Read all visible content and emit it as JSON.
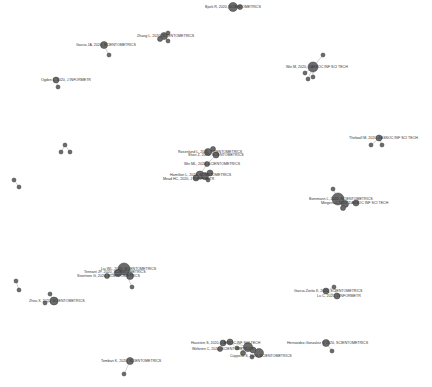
{
  "diagram": {
    "type": "network",
    "background": "#ffffff",
    "node_color": "#6b6b6b",
    "node_stroke": "#3a3a3a",
    "edge_color": "#c8c8c8",
    "label_color": "#333333",
    "nodes": [
      {
        "id": "n1",
        "x": 233,
        "y": 7,
        "r": 4.5,
        "label": "Bjork R, 2020, SCIENTOMETRICS",
        "lx": 205
      },
      {
        "id": "n1b",
        "x": 240,
        "y": 7,
        "r": 2.5
      },
      {
        "id": "n2",
        "x": 164,
        "y": 36,
        "r": 3.5,
        "label": "Zhang L, 2020, SCIENTOMETRICS",
        "lx": 137
      },
      {
        "id": "n2b",
        "x": 160,
        "y": 39,
        "r": 2.5
      },
      {
        "id": "n2c",
        "x": 168,
        "y": 33,
        "r": 2
      },
      {
        "id": "n2d",
        "x": 168,
        "y": 41,
        "r": 2
      },
      {
        "id": "n3",
        "x": 104,
        "y": 45,
        "r": 3.5,
        "label": "Garcia JA, 2020, SCIENTOMETRICS",
        "lx": 76
      },
      {
        "id": "n3b",
        "x": 109,
        "y": 55,
        "r": 2
      },
      {
        "id": "n4",
        "x": 56,
        "y": 80,
        "r": 3,
        "label": "Ogden L, 2020, J INFORMETR",
        "lx": 41
      },
      {
        "id": "n4b",
        "x": 58,
        "y": 87,
        "r": 2
      },
      {
        "id": "n5",
        "x": 313,
        "y": 67,
        "r": 5,
        "label": "Wei M, 2020, J ASSOC INF SCI TECH",
        "lx": 286
      },
      {
        "id": "n5b",
        "x": 323,
        "y": 55,
        "r": 2
      },
      {
        "id": "n5c",
        "x": 305,
        "y": 73,
        "r": 2
      },
      {
        "id": "n5d",
        "x": 313,
        "y": 77,
        "r": 2
      },
      {
        "id": "n5e",
        "x": 308,
        "y": 79,
        "r": 2
      },
      {
        "id": "n6",
        "x": 379,
        "y": 138,
        "r": 3,
        "label": "Thelwall M, 2020, J ASSOC INF SCI TECH",
        "lx": 349
      },
      {
        "id": "n6b",
        "x": 371,
        "y": 145,
        "r": 2
      },
      {
        "id": "n6c",
        "x": 382,
        "y": 145,
        "r": 2
      },
      {
        "id": "n7",
        "x": 208,
        "y": 152,
        "r": 3.5,
        "label": "Rosenlund L, 2020, SCIENTOMETRICS",
        "lx": 178
      },
      {
        "id": "n7b",
        "x": 213,
        "y": 149,
        "r": 2.5
      },
      {
        "id": "n7c",
        "x": 216,
        "y": 155,
        "r": 3,
        "label": "Shen Z, 2020, SCIENTOMETRICS",
        "lx": 188,
        "ly": 155
      },
      {
        "id": "n8",
        "x": 207,
        "y": 164,
        "r": 2.5,
        "label": "Wei ML, 2020, SCIENTOMETRICS",
        "lx": 184
      },
      {
        "id": "n9",
        "x": 200,
        "y": 175,
        "r": 4,
        "label": "Hamilton L, 2020, SCIENTOMETRICS",
        "lx": 170
      },
      {
        "id": "n9b",
        "x": 205,
        "y": 176,
        "r": 3.5
      },
      {
        "id": "n9c",
        "x": 210,
        "y": 173,
        "r": 3
      },
      {
        "id": "n9d",
        "x": 196,
        "y": 178,
        "r": 3,
        "label": "Mead HC, 2020, J INFORMETR",
        "lx": 163,
        "ly": 179
      },
      {
        "id": "n9e",
        "x": 208,
        "y": 180,
        "r": 2
      },
      {
        "id": "n10",
        "x": 65,
        "y": 145,
        "r": 2
      },
      {
        "id": "n10b",
        "x": 61,
        "y": 152,
        "r": 2
      },
      {
        "id": "n10c",
        "x": 70,
        "y": 152,
        "r": 2
      },
      {
        "id": "n11",
        "x": 14,
        "y": 180,
        "r": 2
      },
      {
        "id": "n11b",
        "x": 19,
        "y": 187,
        "r": 2
      },
      {
        "id": "n12",
        "x": 338,
        "y": 199,
        "r": 6,
        "label": "Bornmann L, 2020, SCIENTOMETRICS",
        "lx": 309
      },
      {
        "id": "n12b",
        "x": 345,
        "y": 204,
        "r": 3.5,
        "label": "Mingers J, 2020, J ASSOC INF SCI TECH",
        "lx": 321,
        "ly": 203
      },
      {
        "id": "n12c",
        "x": 356,
        "y": 203,
        "r": 3
      },
      {
        "id": "n12d",
        "x": 343,
        "y": 208,
        "r": 2.5
      },
      {
        "id": "n12e",
        "x": 333,
        "y": 189,
        "r": 2
      },
      {
        "id": "n13",
        "x": 124,
        "y": 269,
        "r": 6,
        "label": "Liu WL, 2020, SCIENTOMETRICS",
        "lx": 101
      },
      {
        "id": "n13b",
        "x": 118,
        "y": 273,
        "r": 3.5,
        "label": "Tennant JP, 2020, SCIENTOMETRICS",
        "lx": 84,
        "ly": 272
      },
      {
        "id": "n13c",
        "x": 130,
        "y": 276,
        "r": 3.5
      },
      {
        "id": "n13d",
        "x": 107,
        "y": 276,
        "r": 2.5,
        "label": "Sivertsen G, 2020, SCIENTOMETRICS",
        "lx": 77,
        "ly": 276
      },
      {
        "id": "n13e",
        "x": 132,
        "y": 287,
        "r": 2
      },
      {
        "id": "n14",
        "x": 54,
        "y": 301,
        "r": 4,
        "label": "Zhou X, 2020, SCIENTOMETRICS",
        "lx": 29
      },
      {
        "id": "n14b",
        "x": 45,
        "y": 303,
        "r": 2
      },
      {
        "id": "n14c",
        "x": 50,
        "y": 294,
        "r": 2
      },
      {
        "id": "n15",
        "x": 16,
        "y": 281,
        "r": 2
      },
      {
        "id": "n15b",
        "x": 19,
        "y": 290,
        "r": 2
      },
      {
        "id": "n16",
        "x": 326,
        "y": 291,
        "r": 3,
        "label": "Garcia-Zorita K, 2020, SCIENTOMETRICS",
        "lx": 294
      },
      {
        "id": "n16b",
        "x": 334,
        "y": 287,
        "r": 2
      },
      {
        "id": "n16c",
        "x": 337,
        "y": 296,
        "r": 3,
        "label": "Lu C, 2020, J INFORMETR",
        "lx": 317,
        "ly": 296
      },
      {
        "id": "n17",
        "x": 223,
        "y": 343,
        "r": 3,
        "label": "Haustein S, 2020, J ASSOC INF SCI TECH",
        "lx": 191
      },
      {
        "id": "n17b",
        "x": 230,
        "y": 342,
        "r": 3
      },
      {
        "id": "n17c",
        "x": 220,
        "y": 349,
        "r": 2.5,
        "label": "Weltzien C, 2020, SCIENTOMETRICS",
        "lx": 192,
        "ly": 349
      },
      {
        "id": "n17d",
        "x": 248,
        "y": 347,
        "r": 4.5
      },
      {
        "id": "n17e",
        "x": 259,
        "y": 353,
        "r": 4.5,
        "label": "Cuppello S, 2020, SCIENTOMETRICS",
        "lx": 230,
        "ly": 356
      },
      {
        "id": "n17f",
        "x": 253,
        "y": 350,
        "r": 3
      },
      {
        "id": "n17g",
        "x": 252,
        "y": 357,
        "r": 2
      },
      {
        "id": "n17h",
        "x": 243,
        "y": 353,
        "r": 2.5
      },
      {
        "id": "n17i",
        "x": 237,
        "y": 348,
        "r": 2
      },
      {
        "id": "n18",
        "x": 326,
        "y": 343,
        "r": 3.5,
        "label": "Hernandez-Gonzalez V, 2020, SCIENTOMETRICS",
        "lx": 287
      },
      {
        "id": "n18b",
        "x": 332,
        "y": 351,
        "r": 2
      },
      {
        "id": "n19",
        "x": 130,
        "y": 361,
        "r": 3.5,
        "label": "Tombari K, 2020, SCIENTOMETRICS",
        "lx": 101
      },
      {
        "id": "n19b",
        "x": 124,
        "y": 374,
        "r": 2
      }
    ],
    "edges": [
      [
        "n1",
        "n1b"
      ],
      [
        "n2",
        "n2b"
      ],
      [
        "n2",
        "n2c"
      ],
      [
        "n2",
        "n2d"
      ],
      [
        "n3",
        "n3b"
      ],
      [
        "n4",
        "n4b"
      ],
      [
        "n5",
        "n5b"
      ],
      [
        "n5",
        "n5c"
      ],
      [
        "n5",
        "n5d"
      ],
      [
        "n5",
        "n5e"
      ],
      [
        "n6",
        "n6b"
      ],
      [
        "n6",
        "n6c"
      ],
      [
        "n7",
        "n7b"
      ],
      [
        "n7",
        "n7c"
      ],
      [
        "n7b",
        "n7c"
      ],
      [
        "n7c",
        "n8"
      ],
      [
        "n8",
        "n9"
      ],
      [
        "n9",
        "n9b"
      ],
      [
        "n9b",
        "n9c"
      ],
      [
        "n9",
        "n9d"
      ],
      [
        "n9b",
        "n9e"
      ],
      [
        "n10",
        "n10b"
      ],
      [
        "n10",
        "n10c"
      ],
      [
        "n11",
        "n11b"
      ],
      [
        "n12",
        "n12b"
      ],
      [
        "n12",
        "n12c"
      ],
      [
        "n12",
        "n12d"
      ],
      [
        "n12",
        "n12e"
      ],
      [
        "n12b",
        "n12c"
      ],
      [
        "n13",
        "n13b"
      ],
      [
        "n13",
        "n13c"
      ],
      [
        "n13",
        "n13d"
      ],
      [
        "n13",
        "n13e"
      ],
      [
        "n13b",
        "n13d"
      ],
      [
        "n14",
        "n14b"
      ],
      [
        "n14",
        "n14c"
      ],
      [
        "n15",
        "n15b"
      ],
      [
        "n16",
        "n16b"
      ],
      [
        "n16",
        "n16c"
      ],
      [
        "n16b",
        "n16c"
      ],
      [
        "n17",
        "n17b"
      ],
      [
        "n17",
        "n17c"
      ],
      [
        "n17b",
        "n17d"
      ],
      [
        "n17d",
        "n17e"
      ],
      [
        "n17d",
        "n17f"
      ],
      [
        "n17e",
        "n17g"
      ],
      [
        "n17f",
        "n17h"
      ],
      [
        "n17i",
        "n17d"
      ],
      [
        "n17b",
        "n17i"
      ],
      [
        "n18",
        "n18b"
      ],
      [
        "n19",
        "n19b"
      ]
    ]
  }
}
